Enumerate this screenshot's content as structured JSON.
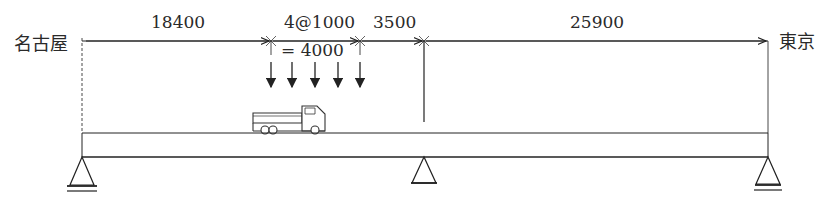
{
  "diagram": {
    "type": "continuous-beam-loading",
    "left_end_label": "名古屋",
    "right_end_label": "東京",
    "dimensions": [
      {
        "label": "18400",
        "from_x": 82,
        "to_x": 271
      },
      {
        "label": "4@1000",
        "from_x": 271,
        "to_x": 360
      },
      {
        "label": "3500",
        "from_x": 360,
        "to_x": 424
      },
      {
        "label": "25900",
        "from_x": 424,
        "to_x": 768
      }
    ],
    "load_group_total": "= 4000",
    "point_loads_count": 5,
    "supports": [
      {
        "name": "left-support",
        "x": 82
      },
      {
        "name": "middle-support",
        "x": 424
      },
      {
        "name": "right-support",
        "x": 768
      }
    ],
    "vehicle": "truck",
    "colors": {
      "line": "#222222",
      "text": "#2a2a2a",
      "background": "#ffffff"
    }
  }
}
